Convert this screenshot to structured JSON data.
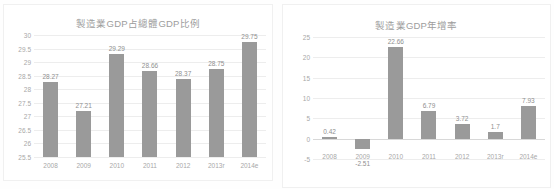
{
  "colors": {
    "bar": "#9a9a9a",
    "gridline": "#ededed",
    "axis_text": "#a8a8a8",
    "title_text": "#9d9d9d",
    "label_text": "#8f8f8f",
    "panel_border": "#f0f0f0",
    "background": "#ffffff"
  },
  "chart_data": [
    {
      "id": "manufacturing-gdp-share",
      "type": "bar",
      "title": "製造業GDP占總體GDP比例",
      "xlabel": "",
      "ylabel": "",
      "ylim": [
        25.5,
        30
      ],
      "yticks": [
        "30",
        "29.5",
        "29",
        "28.5",
        "28",
        "27.5",
        "27",
        "26.5",
        "26",
        "25.5"
      ],
      "ytick_values": [
        30,
        29.5,
        29,
        28.5,
        28,
        27.5,
        27,
        26.5,
        26,
        25.5
      ],
      "grid": true,
      "legend": "none",
      "categories": [
        "2008",
        "2009",
        "2010",
        "2011",
        "2012",
        "2013r",
        "2014e"
      ],
      "values": [
        28.27,
        27.21,
        29.29,
        28.66,
        28.37,
        28.75,
        29.75
      ],
      "data_labels": [
        "28.27",
        "27.21",
        "29.29",
        "28.66",
        "28.37",
        "28.75",
        "29.75"
      ]
    },
    {
      "id": "manufacturing-gdp-growth",
      "type": "bar",
      "title": "製造業GDP年增率",
      "xlabel": "",
      "ylabel": "",
      "ylim": [
        -5,
        25
      ],
      "yticks": [
        "25",
        "20",
        "15",
        "10",
        "5",
        "0",
        "-5"
      ],
      "ytick_values": [
        25,
        20,
        15,
        10,
        5,
        0,
        -5
      ],
      "grid": true,
      "legend": "none",
      "categories": [
        "2008",
        "2009",
        "2010",
        "2011",
        "2012",
        "2013r",
        "2014e"
      ],
      "values": [
        0.42,
        -2.51,
        22.66,
        6.79,
        3.72,
        1.7,
        7.93
      ],
      "data_labels": [
        "0.42",
        "-2.51",
        "22.66",
        "6.79",
        "3.72",
        "1.7",
        "7.93"
      ]
    }
  ]
}
